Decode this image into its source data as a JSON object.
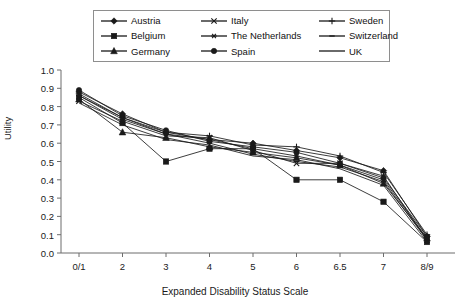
{
  "chart_data": {
    "type": "line",
    "title": "",
    "xlabel": "Expanded Disability Status Scale",
    "ylabel": "Utility",
    "categories": [
      "0/1",
      "2",
      "3",
      "4",
      "5",
      "6",
      "6.5",
      "7",
      "8/9"
    ],
    "ylim": [
      0.0,
      1.0
    ],
    "ytick_labels": [
      "0.0",
      "0.1",
      "0.2",
      "0.3",
      "0.4",
      "0.5",
      "0.6",
      "0.7",
      "0.8",
      "0.9",
      "1.0"
    ],
    "ytick_values": [
      0.0,
      0.1,
      0.2,
      0.3,
      0.4,
      0.5,
      0.6,
      0.7,
      0.8,
      0.9,
      1.0
    ],
    "grid": false,
    "legend_position": "top-center",
    "series": [
      {
        "name": "Austria",
        "marker": "diamond",
        "values": [
          0.88,
          0.76,
          0.66,
          0.62,
          0.6,
          0.56,
          0.52,
          0.45,
          0.09
        ]
      },
      {
        "name": "Belgium",
        "marker": "square",
        "values": [
          0.85,
          0.71,
          0.5,
          0.57,
          0.57,
          0.4,
          0.4,
          0.28,
          0.06
        ]
      },
      {
        "name": "Germany",
        "marker": "triangle",
        "values": [
          0.84,
          0.66,
          0.63,
          0.58,
          0.55,
          0.52,
          0.48,
          0.38,
          0.08
        ]
      },
      {
        "name": "Italy",
        "marker": "x",
        "values": [
          0.83,
          0.72,
          0.64,
          0.63,
          0.56,
          0.49,
          0.49,
          0.42,
          0.07
        ]
      },
      {
        "name": "The Netherlands",
        "marker": "asterisk",
        "values": [
          0.86,
          0.74,
          0.65,
          0.62,
          0.57,
          0.53,
          0.48,
          0.4,
          0.08
        ]
      },
      {
        "name": "Spain",
        "marker": "circle",
        "values": [
          0.89,
          0.75,
          0.67,
          0.61,
          0.58,
          0.55,
          0.49,
          0.41,
          0.09
        ]
      },
      {
        "name": "Sweden",
        "marker": "plus",
        "values": [
          0.87,
          0.74,
          0.66,
          0.64,
          0.59,
          0.58,
          0.53,
          0.44,
          0.1
        ]
      },
      {
        "name": "Switzerland",
        "marker": "dash",
        "values": [
          0.86,
          0.73,
          0.65,
          0.6,
          0.54,
          0.5,
          0.47,
          0.39,
          0.07
        ]
      },
      {
        "name": "UK",
        "marker": "none",
        "values": [
          0.82,
          0.7,
          0.62,
          0.59,
          0.53,
          0.51,
          0.46,
          0.37,
          0.06
        ]
      }
    ]
  },
  "axes": {
    "ylabel": "Utility",
    "xlabel": "Expanded Disability Status Scale"
  },
  "legend": {
    "entries": [
      {
        "label": "Austria",
        "marker": "diamond"
      },
      {
        "label": "Italy",
        "marker": "x"
      },
      {
        "label": "Sweden",
        "marker": "plus"
      },
      {
        "label": "Belgium",
        "marker": "square"
      },
      {
        "label": "The Netherlands",
        "marker": "asterisk"
      },
      {
        "label": "Switzerland",
        "marker": "dash"
      },
      {
        "label": "Germany",
        "marker": "triangle"
      },
      {
        "label": "Spain",
        "marker": "circle"
      },
      {
        "label": "UK",
        "marker": "none"
      }
    ]
  },
  "colors": {
    "line": "#1a1a1a",
    "axis": "#6d6d6d",
    "legend_border": "#8e8e8e",
    "background": "#ffffff"
  }
}
